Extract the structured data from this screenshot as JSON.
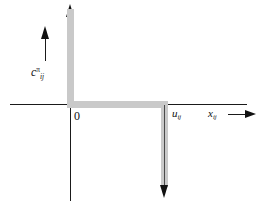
{
  "figure": {
    "type": "step-function-plot",
    "background_color": "#ffffff",
    "axis_color": "#1a1a1a",
    "highlight_color": "#c9c9c9",
    "arrow_color": "#111111"
  },
  "labels": {
    "y_axis": {
      "base": "c",
      "subscript": "ij",
      "superscript": "π"
    },
    "x_axis": {
      "base": "x",
      "subscript": "ij"
    },
    "origin": "0",
    "upper_bound": {
      "base": "u",
      "subscript": "ij"
    }
  },
  "icons": {
    "y_axis_arrow": "arrow-up-icon",
    "x_axis_arrow": "arrow-right-icon",
    "drop_arrow": "arrow-down-icon",
    "c_direction_arrow": "arrow-up-icon"
  },
  "chart_data": {
    "type": "line",
    "title": "",
    "xlabel": "x_ij",
    "ylabel": "c_ij^pi",
    "x": [
      0,
      0,
      0,
      1,
      1,
      1
    ],
    "y": [
      1,
      0,
      0,
      0,
      0,
      -1
    ],
    "segments": [
      {
        "name": "upward ray at x = 0",
        "orientation": "vertical",
        "x": 0,
        "y_from": 0,
        "y_to": "+infinity",
        "arrow": "up"
      },
      {
        "name": "zero plateau",
        "orientation": "horizontal",
        "y": 0,
        "x_from": 0,
        "x_to": "u_ij",
        "arrow": "none"
      },
      {
        "name": "downward ray at x = u_ij",
        "orientation": "vertical",
        "x": "u_ij",
        "y_from": 0,
        "y_to": "-infinity",
        "arrow": "down"
      }
    ],
    "xticks": [
      "0",
      "u_ij"
    ],
    "yticks": [],
    "grid": false,
    "legend": false
  }
}
